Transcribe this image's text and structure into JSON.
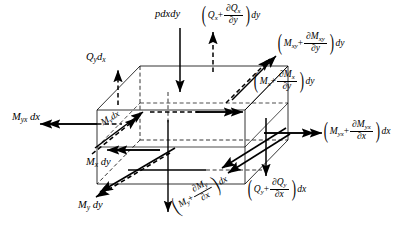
{
  "figure": {
    "type": "free-body-diagram",
    "element_shape": "rectangular parallelepiped (isometric box)"
  },
  "labels": {
    "load_top": {
      "text": "pdxdy",
      "role": "distributed-pressure-load",
      "arrow": "down"
    },
    "qy_dx": {
      "base": "Q",
      "sub": "y",
      "tail": "d",
      "tail_sub": "x",
      "role": "shear-force-left-top",
      "arrow": "up"
    },
    "qx_plus": {
      "lead": "Q",
      "lead_sub": "x",
      "op": "+",
      "num": "∂Q",
      "num_sub": "x",
      "den": "∂y",
      "trail": "dy",
      "role": "shear-force-back-face",
      "arrow": "up"
    },
    "mxy_plus": {
      "lead": "M",
      "lead_sub": "xy",
      "op": "+",
      "num": "∂M",
      "num_sub": "xy",
      "den": "∂y",
      "trail": "dy",
      "role": "twisting-moment-back-face",
      "arrow": "double-up-right"
    },
    "mx_plus": {
      "lead": "M",
      "lead_sub": "x",
      "op": "+",
      "num": "∂M",
      "num_sub": "x",
      "den": "∂y",
      "trail": "dy",
      "role": "bending-moment-back-face",
      "arrow": "double-right"
    },
    "myx_plus": {
      "lead": "M",
      "lead_sub": "yx",
      "op": "+",
      "num": "∂M",
      "num_sub": "yx",
      "den": "∂x",
      "trail": "dx",
      "role": "twisting-moment-right-face",
      "arrow": "double-right"
    },
    "qy_plus": {
      "lead": "Q",
      "lead_sub": "y",
      "op": "+",
      "num": "∂Q",
      "num_sub": "y",
      "den": "∂x",
      "trail": "dx",
      "role": "shear-force-right-face",
      "arrow": "down"
    },
    "my_plus": {
      "lead": "M",
      "lead_sub": "y",
      "op": "+",
      "num": "∂M",
      "num_sub": "y",
      "den": "∂x",
      "trail": "dx",
      "role": "bending-moment-right-face",
      "arrow": "double-down-left",
      "rotated": true
    },
    "myx_dx": {
      "base": "M",
      "sub": "yx",
      "tail": "dx",
      "role": "twisting-moment-left-face",
      "arrow": "double-left"
    },
    "mx_dy": {
      "base": "M",
      "sub": "x",
      "tail": "dy",
      "role": "bending-moment-front-face",
      "arrow": "double-left"
    },
    "my_dy": {
      "base": "M",
      "sub": "y",
      "tail": "dy",
      "role": "bending-moment-front-bottom",
      "arrow": "double-down-left"
    },
    "my_dx": {
      "base": "M",
      "sub": "y",
      "tail": "dx",
      "role": "bending-moment-diagonal",
      "arrow": "double-up-right",
      "rotated": true
    }
  },
  "colors": {
    "stroke": "#000000",
    "background": "#ffffff",
    "solid_edge": "#000000",
    "hidden_edge": "#000000"
  }
}
